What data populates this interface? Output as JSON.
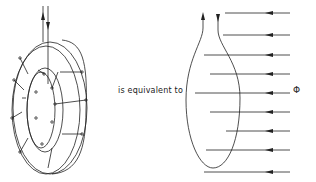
{
  "diagram": {
    "left_figure": {
      "name": "toroidal-coil",
      "description": "Toroid core with winding turns and two leads (one current arrow up, one down)"
    },
    "connector_text": "is equivalent to",
    "right_figure": {
      "name": "single-loop-in-flux",
      "description": "Elongated single loop with two leads, threaded by parallel flux lines pointing left",
      "flux_label": "Φ",
      "flux_lines_count": 9
    },
    "colors": {
      "stroke": "#222222",
      "background": "#ffffff"
    }
  }
}
